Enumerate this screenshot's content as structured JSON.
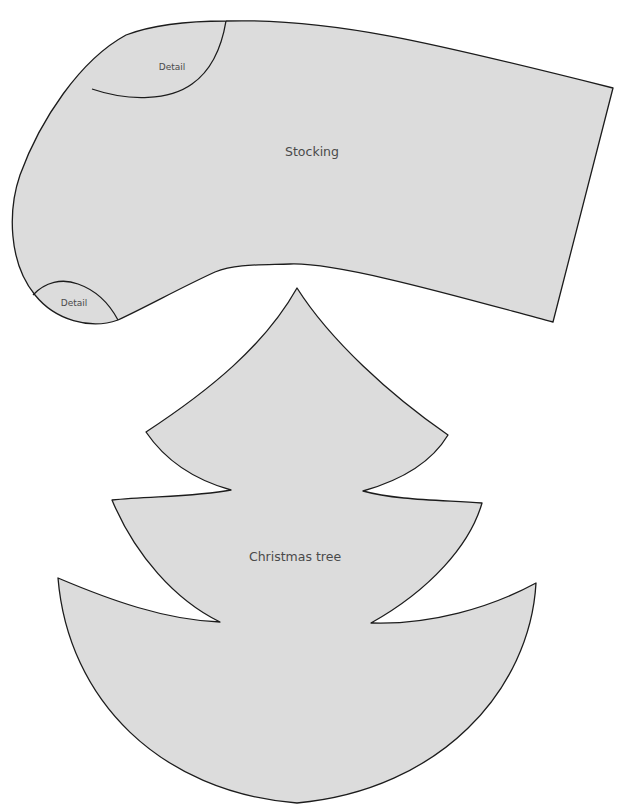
{
  "pieces": {
    "stocking": {
      "label": "Stocking",
      "details": [
        {
          "label": "Detail",
          "position": "top-left (cuff curve)"
        },
        {
          "label": "Detail",
          "position": "bottom-left (toe curve)"
        }
      ]
    },
    "tree": {
      "label": "Christmas tree",
      "tiers": 3
    }
  },
  "colors": {
    "fill": "#dcdcdc",
    "outline": "#1c1c1c",
    "label": "#4a4a4a",
    "background": "#ffffff"
  }
}
